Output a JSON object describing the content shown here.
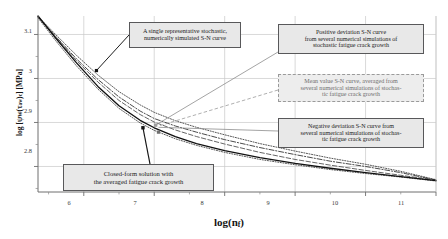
{
  "chart_data": {
    "type": "line",
    "title": "",
    "xlabel": "log(n_f)",
    "ylabel": "log[ψw(τaw)c] [MPa]",
    "xlim": [
      5.35,
      11.0
    ],
    "ylim": [
      2.742,
      3.142
    ],
    "xticks": [
      6,
      7,
      8,
      9,
      10,
      11
    ],
    "yticks": [
      2.8,
      2.9,
      3,
      3.1
    ],
    "xtick_labels": [
      "6",
      "7",
      "8",
      "9",
      "10",
      "11"
    ],
    "ytick_labels": [
      "2.8",
      "2.9",
      "3",
      "3.1"
    ],
    "grid": true,
    "legend": "none",
    "minor_ticks": true,
    "series": [
      {
        "name": "Closed-form solution with the averaged fatigue crack growth",
        "style": "solid",
        "color": "#111111",
        "x": [
          5.35,
          5.6,
          5.9,
          6.2,
          6.5,
          6.8,
          7.0,
          7.3,
          7.6,
          8.0,
          8.5,
          9.0,
          9.5,
          10.0,
          10.5,
          11.0
        ],
        "y": [
          3.142,
          3.092,
          3.035,
          2.982,
          2.938,
          2.905,
          2.888,
          2.868,
          2.852,
          2.836,
          2.82,
          2.807,
          2.796,
          2.786,
          2.777,
          2.768
        ]
      },
      {
        "name": "A single representative stochastic, numerically simulated S-N curve",
        "style": "dash-dot",
        "color": "#2b2b2b",
        "x": [
          5.35,
          5.6,
          5.9,
          6.2,
          6.5,
          6.8,
          7.0,
          7.3,
          7.6,
          8.0,
          8.5,
          9.0,
          9.5,
          10.0,
          10.5,
          11.0
        ],
        "y": [
          3.14,
          3.096,
          3.044,
          2.998,
          2.958,
          2.926,
          2.909,
          2.892,
          2.878,
          2.861,
          2.843,
          2.827,
          2.812,
          2.8,
          2.786,
          2.769
        ]
      },
      {
        "name": "Positive deviation S-N curve from several numerical simulations of stochastic fatigue crack growth",
        "style": "dotted",
        "color": "#3a3a3a",
        "x": [
          5.35,
          5.6,
          5.9,
          6.2,
          6.5,
          6.8,
          7.0,
          7.3,
          7.6,
          8.0,
          8.5,
          9.0,
          9.5,
          10.0,
          10.5,
          11.0
        ],
        "y": [
          3.141,
          3.1,
          3.052,
          3.008,
          2.97,
          2.94,
          2.923,
          2.904,
          2.889,
          2.872,
          2.852,
          2.835,
          2.819,
          2.805,
          2.789,
          2.77
        ]
      },
      {
        "name": "Mean value S-N curve, averaged from several numerical simulations of stochastic fatigue crack growth",
        "style": "dashed",
        "color": "#4a4a4a",
        "x": [
          5.35,
          5.6,
          5.9,
          6.2,
          6.5,
          6.8,
          7.0,
          7.3,
          7.6,
          8.0,
          8.5,
          9.0,
          9.5,
          10.0,
          10.5,
          11.0
        ],
        "y": [
          3.14,
          3.094,
          3.04,
          2.992,
          2.95,
          2.918,
          2.901,
          2.883,
          2.868,
          2.851,
          2.832,
          2.816,
          2.803,
          2.791,
          2.78,
          2.769
        ]
      },
      {
        "name": "Negative deviation S-N curve from several numerical simulations of stochastic fatigue crack growth",
        "style": "dotted",
        "color": "#3a3a3a",
        "x": [
          5.35,
          5.6,
          5.9,
          6.2,
          6.5,
          6.8,
          7.0,
          7.3,
          7.6,
          8.0,
          8.5,
          9.0,
          9.5,
          10.0,
          10.5,
          11.0
        ],
        "y": [
          3.138,
          3.086,
          3.028,
          2.976,
          2.932,
          2.899,
          2.882,
          2.863,
          2.848,
          2.832,
          2.816,
          2.804,
          2.793,
          2.784,
          2.776,
          2.767
        ]
      }
    ],
    "annotations": [
      {
        "id": "single-representative",
        "lines": [
          "A single representative stochastic,",
          "numerically simulated S-N curve"
        ],
        "marker_x": 6.18,
        "marker_y": 3.018,
        "style": "solid-box"
      },
      {
        "id": "positive-deviation",
        "lines": [
          "Positive deviation S-N curve",
          "from several numerical simulations of",
          "stochastic fatigue crack growth"
        ],
        "marker_x": 7.02,
        "marker_y": 2.894,
        "style": "solid-box"
      },
      {
        "id": "mean-value",
        "lines": [
          "Mean value S-N curve, averaged  from",
          "several numerical simulations of stochas-",
          "tic fatigue crack growth"
        ],
        "marker_x": 7.02,
        "marker_y": 2.894,
        "style": "dashed-box"
      },
      {
        "id": "negative-deviation",
        "lines": [
          "Negative deviation S-N curve from",
          "several numerical simulations of stochas-",
          "tic fatigue crack growth"
        ],
        "marker_x": 7.02,
        "marker_y": 2.894,
        "style": "solid-box"
      },
      {
        "id": "closed-form",
        "lines": [
          "Closed-form solution with",
          "the averaged fatigue crack growth"
        ],
        "marker_x": 6.84,
        "marker_y": 2.888,
        "style": "solid-box"
      }
    ]
  },
  "axes": {
    "y_label_parts": {
      "pre": "log [ψ",
      "sub1": "W",
      "mid": "(τ",
      "sub2": "aw",
      "post": ")",
      "sub3": "c",
      "unit": "] [MPa]"
    },
    "x_label_parts": {
      "pre": "log(n",
      "sub": "f",
      "post": ")"
    }
  },
  "callouts": {
    "single_representative": {
      "line1": "A single representative stochastic,",
      "line2": "numerically simulated S-N curve"
    },
    "positive_deviation": {
      "line1": "Positive deviation S-N curve",
      "line2": "from several numerical simulations of",
      "line3": "stochastic fatigue crack growth"
    },
    "mean_value": {
      "line1": "Mean value S-N curve, averaged  from",
      "line2": "several numerical simulations of stochas-",
      "line3": "tic fatigue crack growth"
    },
    "negative_deviation": {
      "line1": "Negative deviation S-N curve from",
      "line2": "several numerical simulations of stochas-",
      "line3": "tic fatigue crack growth"
    },
    "closed_form": {
      "line1": "Closed-form solution with",
      "line2": "the averaged fatigue crack growth"
    }
  }
}
